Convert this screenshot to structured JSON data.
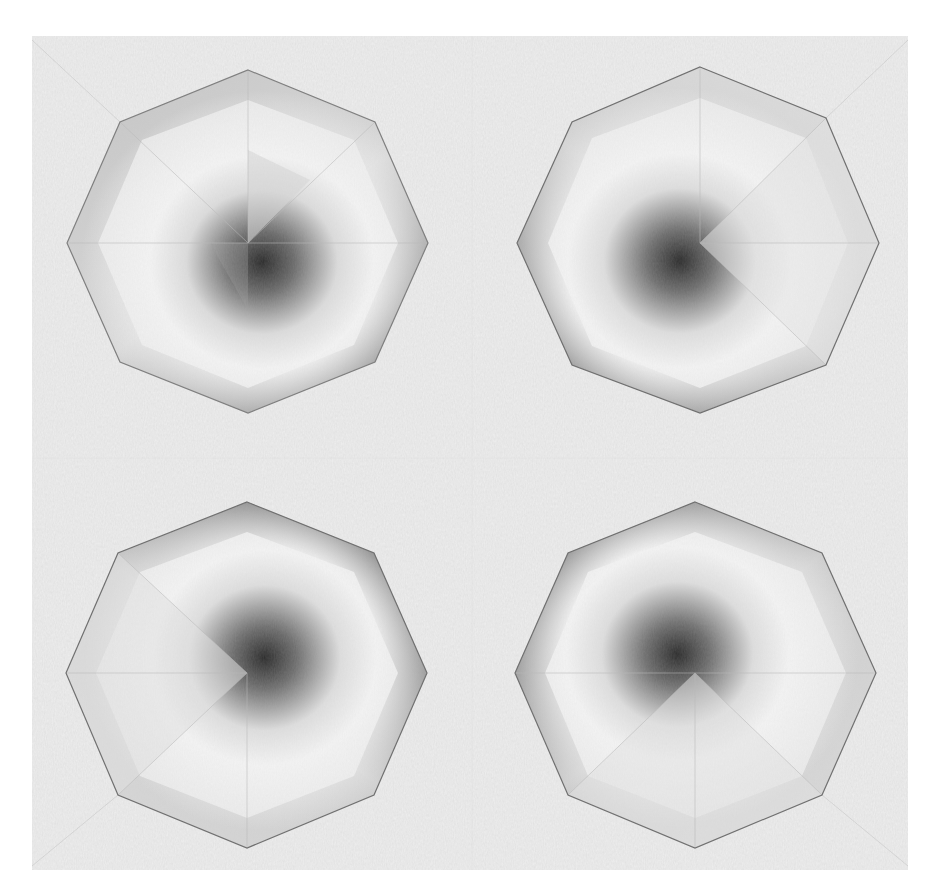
{
  "image": {
    "subject": "Pencil shading study of four octagonal pyramids on textured paper",
    "width": 928,
    "height": 891,
    "background": "#ffffff",
    "paper": {
      "x": 32,
      "y": 36,
      "w": 876,
      "h": 834,
      "color": "#efefef"
    },
    "octagons": [
      {
        "name": "top-left-octagon",
        "center": [
          248,
          243
        ],
        "vertices": [
          [
            248,
            70
          ],
          [
            375,
            122
          ],
          [
            428,
            243
          ],
          [
            375,
            362
          ],
          [
            248,
            413
          ],
          [
            120,
            362
          ],
          [
            67,
            243
          ],
          [
            120,
            122
          ]
        ],
        "darkest_facet": "lower-right-inner",
        "edge_shadow": "right-and-bottom"
      },
      {
        "name": "top-right-octagon",
        "center": [
          700,
          243
        ],
        "vertices": [
          [
            700,
            67
          ],
          [
            826,
            118
          ],
          [
            879,
            243
          ],
          [
            826,
            365
          ],
          [
            700,
            413
          ],
          [
            572,
            365
          ],
          [
            517,
            243
          ],
          [
            572,
            122
          ]
        ],
        "darkest_facet": "lower-left-inner",
        "edge_shadow": "left-and-bottom"
      },
      {
        "name": "bottom-left-octagon",
        "center": [
          247,
          673
        ],
        "vertices": [
          [
            247,
            502
          ],
          [
            374,
            553
          ],
          [
            427,
            673
          ],
          [
            374,
            795
          ],
          [
            247,
            848
          ],
          [
            118,
            795
          ],
          [
            66,
            673
          ],
          [
            118,
            553
          ]
        ],
        "darkest_facet": "upper-right-inner",
        "edge_shadow": "top-and-right"
      },
      {
        "name": "bottom-right-octagon",
        "center": [
          695,
          673
        ],
        "vertices": [
          [
            695,
            502
          ],
          [
            822,
            553
          ],
          [
            876,
            673
          ],
          [
            822,
            795
          ],
          [
            695,
            848
          ],
          [
            568,
            795
          ],
          [
            515,
            673
          ],
          [
            568,
            553
          ]
        ],
        "darkest_facet": "upper-left-inner",
        "edge_shadow": "top-and-left"
      }
    ]
  }
}
